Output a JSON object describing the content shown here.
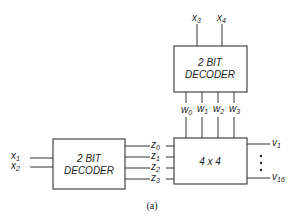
{
  "diagram": {
    "top_decoder": {
      "line1": "2 BIT",
      "line2": "DECODER",
      "inputs": [
        "x3",
        "x4"
      ],
      "input_labels": [
        {
          "base": "x",
          "sub": "3"
        },
        {
          "base": "x",
          "sub": "4"
        }
      ],
      "outputs": [
        {
          "base": "w",
          "sub": "0"
        },
        {
          "base": "w",
          "sub": "1"
        },
        {
          "base": "w",
          "sub": "2"
        },
        {
          "base": "w",
          "sub": "3"
        }
      ]
    },
    "left_decoder": {
      "line1": "2 BIT",
      "line2": "DECODER",
      "input_labels": [
        {
          "base": "x",
          "sub": "1"
        },
        {
          "base": "x",
          "sub": "2"
        }
      ],
      "outputs": [
        {
          "base": "z",
          "sub": "0"
        },
        {
          "base": "z",
          "sub": "1"
        },
        {
          "base": "z",
          "sub": "2"
        },
        {
          "base": "z",
          "sub": "3"
        }
      ]
    },
    "matrix": {
      "label": "4 x 4",
      "outputs": [
        {
          "base": "v",
          "sub": "1"
        },
        {
          "base": "v",
          "sub": "16"
        }
      ],
      "ellipsis": "⋮"
    },
    "caption": "(a)"
  }
}
